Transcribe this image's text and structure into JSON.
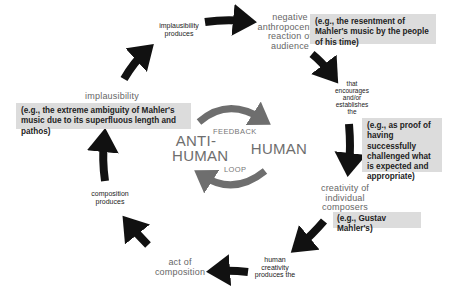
{
  "diagram": {
    "type": "cycle",
    "nodes": {
      "implausibility_produces": "implausibility\nproduces",
      "negative_reaction": "negative\nanthropocentric\nreaction of\naudience",
      "that_encourages": "that\nencourages\nand/or\nestablishes\nthe",
      "creativity": "creativity of\nindividual\ncomposers",
      "human_creativity": "human\ncreativity\nproduces the",
      "act_of_composition": "act of\ncomposition",
      "composition_produces": "composition\nproduces",
      "implausibility": "implausibility"
    },
    "examples": {
      "resentment": "(e.g., the resentment of Mahler's music by the people of his time)",
      "proof": "(e.g., as proof of having successfully challenged what is expected and appropriate)",
      "gustav": "(e.g., Gustav Mahler's)",
      "ambiguity": "(e.g., the extreme ambiguity of Mahler's music due to its superfluous length and pathos)"
    },
    "center": {
      "left": "ANTI-\nHUMAN",
      "right": "HUMAN",
      "top": "FEEDBACK",
      "bottom": "LOOP"
    },
    "colors": {
      "arrow": "#111111",
      "loop_arrow": "#6e6e6e",
      "box": "#dcdcdc",
      "node_text": "#666666"
    }
  }
}
